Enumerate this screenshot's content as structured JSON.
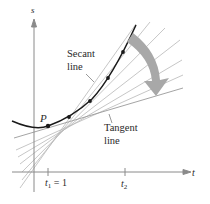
{
  "diagram": {
    "axes": {
      "vertical_label": "s",
      "horizontal_label": "t"
    },
    "point": {
      "label": "P"
    },
    "ticks": [
      {
        "label_var": "t",
        "label_sub": "1",
        "label_rest": " = 1"
      },
      {
        "label_var": "t",
        "label_sub": "2",
        "label_rest": ""
      }
    ],
    "annotations": {
      "secant_line1": "Secant",
      "secant_line2": "line",
      "tangent_line1": "Tangent",
      "tangent_line2": "line"
    },
    "colors": {
      "curve": "#1a1a1a",
      "axes": "#8a8a8a",
      "secant_lines": "#b5b5b5",
      "arrow": "#a8a8a8",
      "text": "#2a2a2a"
    }
  }
}
